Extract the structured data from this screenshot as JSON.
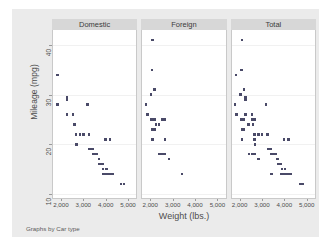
{
  "figure": {
    "y_axis_title": "Mileage (mpg)",
    "x_axis_title": "Weight (lbs.)",
    "note": "Graphs by Car type",
    "y_ticks": [
      "10",
      "20",
      "30",
      "40"
    ],
    "x_ticks": [
      "2,000",
      "3,000",
      "4,000",
      "5,000"
    ],
    "panel_titles": [
      "Domestic",
      "Foreign",
      "Total"
    ],
    "colors": {
      "figure_background": "#ebebeb",
      "panel_background": "#ffffff",
      "panel_header": "#d7d7d7",
      "marker": "#4a4a68",
      "gridline": "#f1f1f1",
      "text": "#4d4d4d"
    }
  },
  "chart_data": {
    "type": "scatter",
    "title": "",
    "xlabel": "Weight (lbs.)",
    "ylabel": "Mileage (mpg)",
    "xlim": [
      1600,
      5400
    ],
    "ylim": [
      9,
      43
    ],
    "xticks": [
      2000,
      3000,
      4000,
      5000
    ],
    "yticks": [
      10,
      20,
      30,
      40
    ],
    "grid": "horizontal",
    "legend": "none",
    "caption": "Graphs by Car type",
    "facet_by": "Car type",
    "panels": [
      {
        "name": "Domestic",
        "points": [
          [
            1800,
            34
          ],
          [
            1800,
            28
          ],
          [
            2230,
            29
          ],
          [
            2230,
            29.5
          ],
          [
            2240,
            26
          ],
          [
            2520,
            26
          ],
          [
            2580,
            24
          ],
          [
            2650,
            22
          ],
          [
            2670,
            20
          ],
          [
            2830,
            22
          ],
          [
            3000,
            22
          ],
          [
            3180,
            28
          ],
          [
            3250,
            22
          ],
          [
            3280,
            19
          ],
          [
            3300,
            19
          ],
          [
            3350,
            19
          ],
          [
            3400,
            19
          ],
          [
            3420,
            18
          ],
          [
            3470,
            18
          ],
          [
            3500,
            18
          ],
          [
            3600,
            18
          ],
          [
            3620,
            18
          ],
          [
            3700,
            17
          ],
          [
            3720,
            16
          ],
          [
            3740,
            16
          ],
          [
            3800,
            16
          ],
          [
            3830,
            16
          ],
          [
            3870,
            16
          ],
          [
            3880,
            14
          ],
          [
            3900,
            15
          ],
          [
            3950,
            14
          ],
          [
            4000,
            21
          ],
          [
            4050,
            15
          ],
          [
            4060,
            14
          ],
          [
            4080,
            14
          ],
          [
            4130,
            14
          ],
          [
            4200,
            21
          ],
          [
            4230,
            14
          ],
          [
            4290,
            14
          ],
          [
            4330,
            14
          ],
          [
            4720,
            12
          ],
          [
            4840,
            12
          ]
        ]
      },
      {
        "name": "Foreign",
        "points": [
          [
            2070,
            41
          ],
          [
            2050,
            35
          ],
          [
            2160,
            31
          ],
          [
            2010,
            30
          ],
          [
            1760,
            28
          ],
          [
            1830,
            26
          ],
          [
            2020,
            25
          ],
          [
            2130,
            25
          ],
          [
            2160,
            25
          ],
          [
            2520,
            25
          ],
          [
            2650,
            25
          ],
          [
            2070,
            23
          ],
          [
            2160,
            23
          ],
          [
            2240,
            24
          ],
          [
            2370,
            24
          ],
          [
            2070,
            21
          ],
          [
            2650,
            21
          ],
          [
            2390,
            18
          ],
          [
            2520,
            18
          ],
          [
            2650,
            18
          ],
          [
            2830,
            17
          ],
          [
            3420,
            14
          ]
        ]
      },
      {
        "name": "Total",
        "points": [
          [
            2070,
            41
          ],
          [
            2050,
            35
          ],
          [
            1800,
            34
          ],
          [
            2160,
            31
          ],
          [
            2010,
            30
          ],
          [
            1760,
            28
          ],
          [
            3180,
            28
          ],
          [
            2230,
            29
          ],
          [
            2230,
            29.5
          ],
          [
            1830,
            26
          ],
          [
            2240,
            26
          ],
          [
            2520,
            26
          ],
          [
            2020,
            25
          ],
          [
            2130,
            25
          ],
          [
            2160,
            25
          ],
          [
            2520,
            25
          ],
          [
            2650,
            25
          ],
          [
            2580,
            24
          ],
          [
            2370,
            24
          ],
          [
            2070,
            23
          ],
          [
            2160,
            23
          ],
          [
            2650,
            22
          ],
          [
            2830,
            22
          ],
          [
            3000,
            22
          ],
          [
            3250,
            22
          ],
          [
            2070,
            21
          ],
          [
            2650,
            21
          ],
          [
            4000,
            21
          ],
          [
            4200,
            21
          ],
          [
            2670,
            20
          ],
          [
            3280,
            19
          ],
          [
            3300,
            19
          ],
          [
            3350,
            19
          ],
          [
            3400,
            19
          ],
          [
            3420,
            18
          ],
          [
            3470,
            18
          ],
          [
            3500,
            18
          ],
          [
            3600,
            18
          ],
          [
            2390,
            18
          ],
          [
            2520,
            18
          ],
          [
            2650,
            18
          ],
          [
            2830,
            17
          ],
          [
            3700,
            17
          ],
          [
            3720,
            16
          ],
          [
            3740,
            16
          ],
          [
            3800,
            16
          ],
          [
            3830,
            16
          ],
          [
            3870,
            16
          ],
          [
            3900,
            15
          ],
          [
            4050,
            15
          ],
          [
            3880,
            14
          ],
          [
            3950,
            14
          ],
          [
            4060,
            14
          ],
          [
            4080,
            14
          ],
          [
            4130,
            14
          ],
          [
            4230,
            14
          ],
          [
            4290,
            14
          ],
          [
            4330,
            14
          ],
          [
            3420,
            14
          ],
          [
            4720,
            12
          ],
          [
            4840,
            12
          ]
        ]
      }
    ]
  }
}
